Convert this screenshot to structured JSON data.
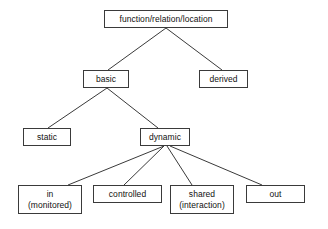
{
  "diagram": {
    "type": "tree",
    "background_color": "#ffffff",
    "box_border_color": "#3a3a3a",
    "edge_color": "#3a3a3a",
    "text_color": "#111111",
    "nodes": [
      {
        "id": "root",
        "label": "function/relation/location",
        "label2": "",
        "x": 104,
        "y": 10,
        "w": 124,
        "h": 18
      },
      {
        "id": "basic",
        "label": "basic",
        "label2": "",
        "x": 83,
        "y": 70,
        "w": 46,
        "h": 18
      },
      {
        "id": "derived",
        "label": "derived",
        "label2": "",
        "x": 199,
        "y": 70,
        "w": 49,
        "h": 18
      },
      {
        "id": "static",
        "label": "static",
        "label2": "",
        "x": 23,
        "y": 128,
        "w": 48,
        "h": 18
      },
      {
        "id": "dynamic",
        "label": "dynamic",
        "label2": "",
        "x": 140,
        "y": 128,
        "w": 50,
        "h": 18
      },
      {
        "id": "in",
        "label": "in",
        "label2": "(monitored)",
        "x": 18,
        "y": 185,
        "w": 64,
        "h": 29
      },
      {
        "id": "controlled",
        "label": "controlled",
        "label2": "",
        "x": 93,
        "y": 185,
        "w": 69,
        "h": 18
      },
      {
        "id": "shared",
        "label": "shared",
        "label2": "(interaction)",
        "x": 170,
        "y": 185,
        "w": 64,
        "h": 29
      },
      {
        "id": "out",
        "label": "out",
        "label2": "",
        "x": 246,
        "y": 185,
        "w": 59,
        "h": 18
      }
    ],
    "edges": [
      {
        "id": "root-basic",
        "from": "root",
        "to": "basic",
        "x1": 166,
        "y1": 28,
        "x2": 108,
        "y2": 70
      },
      {
        "id": "root-derived",
        "from": "root",
        "to": "derived",
        "x1": 166,
        "y1": 28,
        "x2": 222,
        "y2": 70
      },
      {
        "id": "basic-static",
        "from": "basic",
        "to": "static",
        "x1": 107,
        "y1": 88,
        "x2": 48,
        "y2": 128
      },
      {
        "id": "basic-dynamic",
        "from": "basic",
        "to": "dynamic",
        "x1": 107,
        "y1": 88,
        "x2": 158,
        "y2": 128
      },
      {
        "id": "dynamic-in",
        "from": "dynamic",
        "to": "in",
        "x1": 164,
        "y1": 146,
        "x2": 68,
        "y2": 185
      },
      {
        "id": "dynamic-controlled",
        "from": "dynamic",
        "to": "controlled",
        "x1": 164,
        "y1": 146,
        "x2": 124,
        "y2": 185
      },
      {
        "id": "dynamic-shared",
        "from": "dynamic",
        "to": "shared",
        "x1": 167,
        "y1": 146,
        "x2": 192,
        "y2": 185
      },
      {
        "id": "dynamic-out",
        "from": "dynamic",
        "to": "out",
        "x1": 170,
        "y1": 146,
        "x2": 262,
        "y2": 185
      }
    ]
  }
}
